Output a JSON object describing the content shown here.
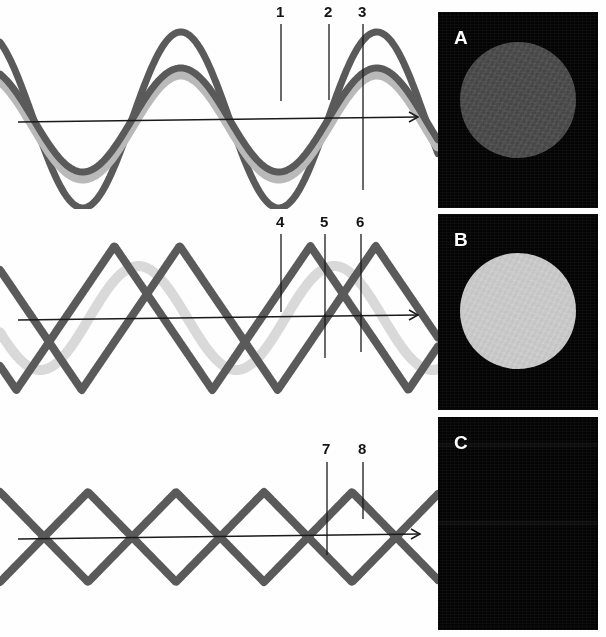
{
  "figure": {
    "background_color": "#fefefe",
    "width": 606,
    "height": 637
  },
  "colors": {
    "wave_dark": "#5a5a5a",
    "wave_dark_stroke": "#565656",
    "wave_halo": "#b9b9b9",
    "wave_faint": "#d9d9d9",
    "axis": "#1a1a1a",
    "callout_line": "#1a1a1a",
    "callout_text": "#141414",
    "panel_bg": "#040404",
    "disc_a": "#4b4b4b",
    "disc_b": "#c9c9c9",
    "letter": "#ffffff"
  },
  "wave_panels": [
    {
      "id": "panel-1",
      "name": "sine-pair-panel",
      "x": 0,
      "y": 4,
      "width": 438,
      "height": 205,
      "axis": {
        "y": 116,
        "x_start": 18,
        "x_end": 418,
        "arrow": true
      },
      "curves": [
        {
          "name": "large-amplitude-sine",
          "kind": "sine",
          "amplitude": 88,
          "wavelength": 196,
          "phase_deg": 118,
          "baseline": 116,
          "color": "#5a5a5a",
          "stroke_width": 7,
          "opacity": 1
        },
        {
          "name": "reduced-amplitude-sine-halo",
          "kind": "sine",
          "amplitude": 52,
          "wavelength": 196,
          "phase_deg": 118,
          "baseline": 122,
          "color": "#b9b9b9",
          "stroke_width": 11,
          "opacity": 1
        },
        {
          "name": "reduced-amplitude-sine",
          "kind": "sine",
          "amplitude": 52,
          "wavelength": 196,
          "phase_deg": 118,
          "baseline": 116,
          "color": "#5a5a5a",
          "stroke_width": 7,
          "opacity": 1
        }
      ],
      "callouts": [
        {
          "label": "1",
          "label_x": 276,
          "label_y": 4,
          "line_x": 281,
          "line_top": 24,
          "line_bottom": 101,
          "target": "rising-edge-of-reduced-amplitude-wave"
        },
        {
          "label": "2",
          "label_x": 324,
          "label_y": 4,
          "line_x": 329,
          "line_top": 24,
          "line_bottom": 100,
          "target": "falling-edge-of-reduced-amplitude-wave"
        },
        {
          "label": "3",
          "label_x": 358,
          "label_y": 4,
          "line_x": 363,
          "line_top": 24,
          "line_bottom": 190,
          "target": "trough-of-large-amplitude-wave"
        }
      ]
    },
    {
      "id": "panel-2",
      "name": "triangular-pair-panel",
      "x": 0,
      "y": 214,
      "width": 438,
      "height": 186,
      "axis": {
        "y": 104,
        "x_start": 18,
        "x_end": 418,
        "arrow": true
      },
      "curves": [
        {
          "name": "faint-background-sine",
          "kind": "sine",
          "amplitude": 52,
          "wavelength": 196,
          "phase_deg": 196,
          "baseline": 104,
          "color": "#d9d9d9",
          "stroke_width": 10,
          "opacity": 1
        },
        {
          "name": "triangular-wave-rightward",
          "kind": "triangle",
          "amplitude": 72,
          "wavelength": 196,
          "phase_deg": 120,
          "baseline": 104,
          "color": "#5a5a5a",
          "stroke_width": 8,
          "opacity": 1
        },
        {
          "name": "triangular-wave-leftward",
          "kind": "triangle",
          "amplitude": 72,
          "wavelength": 196,
          "phase_deg": -120,
          "baseline": 104,
          "color": "#5a5a5a",
          "stroke_width": 8,
          "opacity": 1
        }
      ],
      "callouts": [
        {
          "label": "4",
          "label_x": 276,
          "label_y": 214,
          "line_x": 281,
          "line_top": 234,
          "line_bottom": 312,
          "target": "crossing-point-of-counter-propagating-waves"
        },
        {
          "label": "5",
          "label_x": 320,
          "label_y": 214,
          "line_x": 325,
          "line_top": 234,
          "line_bottom": 358,
          "target": "trough-of-triangular-wave"
        },
        {
          "label": "6",
          "label_x": 356,
          "label_y": 214,
          "line_x": 361,
          "line_top": 234,
          "line_bottom": 352,
          "target": "faint-background-sine-wave"
        }
      ]
    },
    {
      "id": "panel-3",
      "name": "standing-wave-panel",
      "x": 0,
      "y": 432,
      "width": 438,
      "height": 200,
      "axis": {
        "y": 105,
        "x_start": 18,
        "x_end": 420,
        "arrow": true
      },
      "curves": [
        {
          "name": "standing-wave-envelope-upper",
          "kind": "triangle",
          "amplitude": 45,
          "wavelength": 176,
          "phase_deg": 90,
          "baseline": 105,
          "color": "#5a5a5a",
          "stroke_width": 8,
          "opacity": 1
        },
        {
          "name": "standing-wave-envelope-lower",
          "kind": "triangle",
          "amplitude": 45,
          "wavelength": 176,
          "phase_deg": -90,
          "baseline": 105,
          "color": "#5a5a5a",
          "stroke_width": 8,
          "opacity": 1
        }
      ],
      "callouts": [
        {
          "label": "7",
          "label_x": 322,
          "label_y": 441,
          "line_x": 327,
          "line_top": 462,
          "line_bottom": 555,
          "target": "node-crossing-lower-lobe"
        },
        {
          "label": "8",
          "label_x": 358,
          "label_y": 441,
          "line_x": 363,
          "line_top": 462,
          "line_bottom": 519,
          "target": "antinode-rising-edge"
        }
      ]
    }
  ],
  "image_panels": [
    {
      "id": "img-a",
      "name": "image-panel-a",
      "letter": "A",
      "letter_x": 16,
      "letter_y": 16,
      "x": 438,
      "y": 12,
      "width": 160,
      "height": 196,
      "background": "#040404",
      "disc": {
        "visible": true,
        "cx": 80,
        "cy": 88,
        "r": 58,
        "color": "#4b4b4b",
        "description": "medium-gray transmitted-light disc"
      }
    },
    {
      "id": "img-b",
      "name": "image-panel-b",
      "letter": "B",
      "letter_x": 16,
      "letter_y": 16,
      "x": 438,
      "y": 214,
      "width": 160,
      "height": 196,
      "background": "#040404",
      "disc": {
        "visible": true,
        "cx": 80,
        "cy": 97,
        "r": 58,
        "color": "#c9c9c9",
        "description": "bright light-gray transmitted-light disc"
      }
    },
    {
      "id": "img-c",
      "name": "image-panel-c",
      "letter": "C",
      "letter_x": 16,
      "letter_y": 16,
      "x": 438,
      "y": 417,
      "width": 160,
      "height": 213,
      "background": "#040404",
      "disc": {
        "visible": false,
        "cx": 80,
        "cy": 100,
        "r": 58,
        "color": "#040404",
        "description": "fully extinguished field, no visible disc"
      }
    }
  ]
}
